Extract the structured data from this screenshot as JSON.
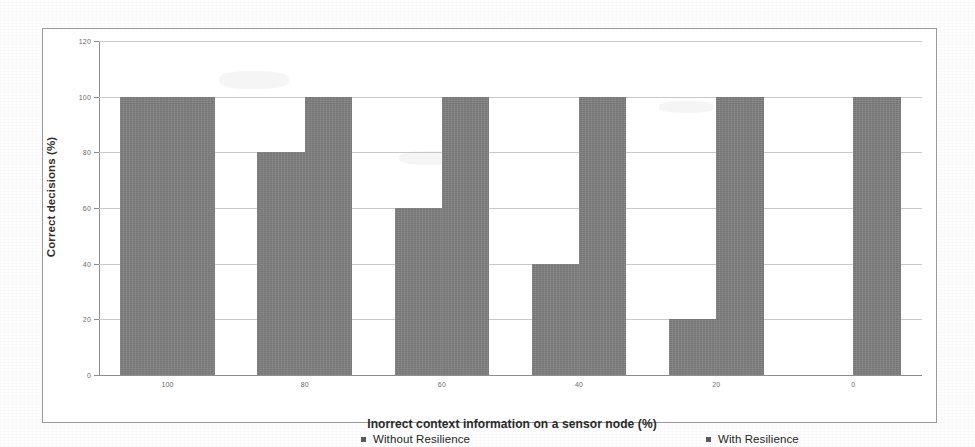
{
  "figure": {
    "y_axis_title": "Correct decisions (%)",
    "x_axis_title": "Inorrect context information on a sensor node (%)"
  },
  "legend": {
    "entries": [
      {
        "label": "Without Resilience",
        "color": "#808080"
      },
      {
        "label": "With Resilience",
        "color": "#808080"
      }
    ]
  },
  "chart_data": {
    "type": "bar",
    "title": "",
    "xlabel": "Inorrect context information on a sensor node (%)",
    "ylabel": "Correct decisions (%)",
    "categories": [
      "100",
      "80",
      "60",
      "40",
      "20",
      "0"
    ],
    "series": [
      {
        "name": "Without Resilience",
        "values": [
          100,
          80,
          60,
          40,
          20,
          0
        ]
      },
      {
        "name": "With Resilience",
        "values": [
          100,
          100,
          100,
          100,
          100,
          100
        ]
      }
    ],
    "ylim": [
      0,
      120
    ],
    "yticks": [
      0,
      20,
      40,
      60,
      80,
      100,
      120
    ],
    "ytick_labels": [
      "0",
      "20",
      "40",
      "60",
      "80",
      "100",
      "120"
    ],
    "xtick_labels": [
      "100",
      "80",
      "60",
      "40",
      "20",
      "0"
    ],
    "grid": true,
    "legend_position": "bottom",
    "bar_color": "#808080"
  }
}
